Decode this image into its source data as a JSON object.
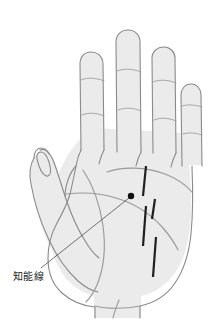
{
  "figure": {
    "type": "palmistry-diagram",
    "background_color": "#ffffff",
    "palm_fill_color": "#ebebeb",
    "palm_outline_color": "#8a8a8a",
    "crease_line_color": "#9a9a9a",
    "marker_color": "#1c1c1c",
    "leader_line_color": "#3a3a3a",
    "width": 224,
    "height": 335
  },
  "annotation": {
    "label": "知能線",
    "label_x": 13,
    "label_y": 271,
    "marker_dot_x": 131,
    "marker_dot_y": 196,
    "marker_dot_radius": 3.2,
    "leader_start_x": 129,
    "leader_start_y": 198,
    "leader_end_x": 41,
    "leader_end_y": 268
  },
  "hand": {
    "fingers": [
      {
        "name": "index-finger",
        "crease_count": 2
      },
      {
        "name": "middle-finger",
        "crease_count": 2
      },
      {
        "name": "ring-finger",
        "crease_count": 2
      },
      {
        "name": "little-finger",
        "crease_count": 2
      }
    ],
    "thumb": {
      "name": "thumb",
      "crease_count": 1
    },
    "palm_creases": [
      {
        "name": "heart-line"
      },
      {
        "name": "head-line"
      },
      {
        "name": "life-line"
      },
      {
        "name": "fate-line"
      }
    ]
  },
  "marks": {
    "description": "short dark slanted bars crossing the head line",
    "count": 4,
    "items": [
      {
        "id": "mark-1",
        "x1": 146,
        "y1": 166,
        "x2": 143,
        "y2": 196
      },
      {
        "id": "mark-2",
        "x1": 155,
        "y1": 199,
        "x2": 152,
        "y2": 218
      },
      {
        "id": "mark-3",
        "x1": 146,
        "y1": 205,
        "x2": 143,
        "y2": 246
      },
      {
        "id": "mark-4",
        "x1": 155,
        "y1": 236,
        "x2": 152,
        "y2": 277
      }
    ]
  }
}
